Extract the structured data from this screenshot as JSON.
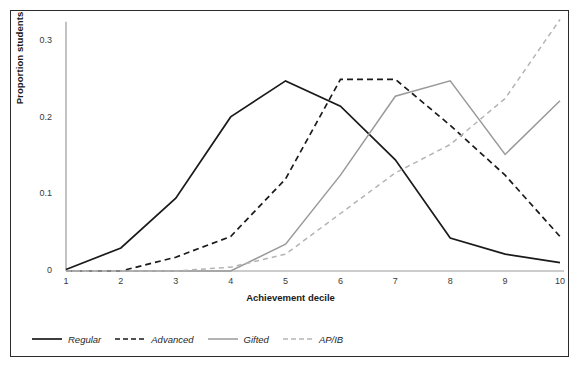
{
  "chart_data": {
    "type": "line",
    "title": "",
    "xlabel": "Achievement decile",
    "ylabel": "Proportion students",
    "categories": [
      1,
      2,
      3,
      4,
      5,
      6,
      7,
      8,
      9,
      10
    ],
    "x": [
      1,
      2,
      3,
      4,
      5,
      6,
      7,
      8,
      9,
      10
    ],
    "xtick_labels": [
      "1",
      "2",
      "3",
      "4",
      "5",
      "6",
      "7",
      "8",
      "9",
      "10"
    ],
    "ytick_labels": [
      "0",
      "0.1",
      "0.2",
      "0.3"
    ],
    "yticks": [
      0,
      0.1,
      0.2,
      0.3
    ],
    "xlim": [
      1,
      10
    ],
    "ylim": [
      0,
      0.345
    ],
    "grid": false,
    "legend_position": "bottom-left",
    "series": [
      {
        "name": "Regular",
        "color": "#1a1a1a",
        "style": "solid",
        "width": 1.7,
        "values": [
          0.002,
          0.03,
          0.095,
          0.201,
          0.248,
          0.215,
          0.145,
          0.043,
          0.022,
          0.011
        ]
      },
      {
        "name": "Advanced",
        "color": "#1a1a1a",
        "style": "dashed",
        "width": 1.7,
        "values": [
          0.0,
          0.0,
          0.018,
          0.045,
          0.12,
          0.25,
          0.25,
          0.19,
          0.125,
          0.045
        ]
      },
      {
        "name": "Gifted",
        "color": "#9a9a9a",
        "style": "solid",
        "width": 1.5,
        "values": [
          0.0,
          0.0,
          0.0,
          0.0,
          0.035,
          0.125,
          0.228,
          0.248,
          0.152,
          0.222
        ]
      },
      {
        "name": "AP/IB",
        "color": "#b4b4b4",
        "style": "dashed",
        "width": 1.5,
        "values": [
          0.0,
          0.0,
          0.0,
          0.005,
          0.022,
          0.075,
          0.128,
          0.165,
          0.225,
          0.328
        ]
      }
    ]
  },
  "legend": {
    "items": [
      {
        "label": "Regular"
      },
      {
        "label": "Advanced"
      },
      {
        "label": "Gifted"
      },
      {
        "label": "AP/IB"
      }
    ]
  },
  "colors": {
    "frame": "#2b2b2b",
    "axis": "#9a9a9a",
    "background": "#ffffff",
    "text": "#1a1a1a"
  }
}
